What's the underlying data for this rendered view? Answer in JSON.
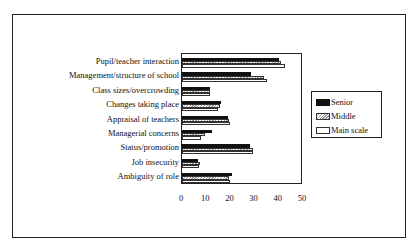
{
  "chart_data": {
    "type": "bar",
    "orientation": "horizontal",
    "title": "",
    "xlabel": "",
    "ylabel": "",
    "xlim": [
      0,
      50
    ],
    "xticks": [
      0,
      10,
      20,
      30,
      40,
      50
    ],
    "grid": false,
    "legend_position": "right",
    "categories": [
      "Pupil/teacher interaction",
      "Management/structure of school",
      "Class sizes/overcrowding",
      "Changes taking place",
      "Appraisal of teachers",
      "Managerial concerns",
      "Status/promotion",
      "Job insecurity",
      "Ambiguity of role"
    ],
    "series": [
      {
        "name": "Senior",
        "values": [
          40,
          28.5,
          11.5,
          16,
          19,
          12.5,
          28,
          6.5,
          20.5
        ]
      },
      {
        "name": "Middle",
        "values": [
          41,
          34,
          11.5,
          15.5,
          19.5,
          9.5,
          29.5,
          7.5,
          19.5
        ]
      },
      {
        "name": "Main scale",
        "values": [
          42.5,
          35,
          11.5,
          15,
          20,
          8,
          29.5,
          7,
          20
        ]
      }
    ]
  },
  "legend": {
    "senior": "Senior",
    "middle": "Middle",
    "main": "Main scale"
  }
}
